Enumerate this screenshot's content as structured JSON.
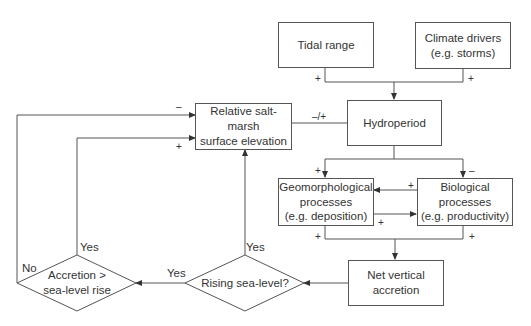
{
  "nodes": {
    "tidal_range": {
      "label": "Tidal range"
    },
    "climate_drivers": {
      "label": "Climate drivers\n(e.g. storms)"
    },
    "hydroperiod": {
      "label": "Hydroperiod"
    },
    "surface_elevation": {
      "label": "Relative salt-marsh\nsurface elevation"
    },
    "geomorphological": {
      "label": "Geomorphological\nprocesses\n(e.g. deposition)"
    },
    "biological": {
      "label": "Biological\nprocesses\n(e.g. productivity)"
    },
    "net_accretion": {
      "label": "Net vertical\naccretion"
    },
    "rising_sea_level": {
      "label": "Rising sea-level?"
    },
    "accretion_vs_slr": {
      "label": "Accretion >\nsea-level rise"
    }
  },
  "edge_labels": {
    "tidal_plus": "+",
    "climate_plus": "+",
    "elevation_hydro": "–/+",
    "hydro_geo_plus": "+",
    "hydro_bio_minus": "–",
    "bio_to_geo_plus": "+",
    "geo_to_bio_plus": "+",
    "geo_net_plus": "+",
    "bio_net_plus": "+",
    "outer_minus": "–",
    "inner_plus": "+",
    "rising_yes_up": "Yes",
    "rising_yes_left": "Yes",
    "accretion_yes": "Yes",
    "accretion_no": "No"
  },
  "colors": {
    "line": "#555555",
    "text": "#333333",
    "background": "#ffffff"
  }
}
